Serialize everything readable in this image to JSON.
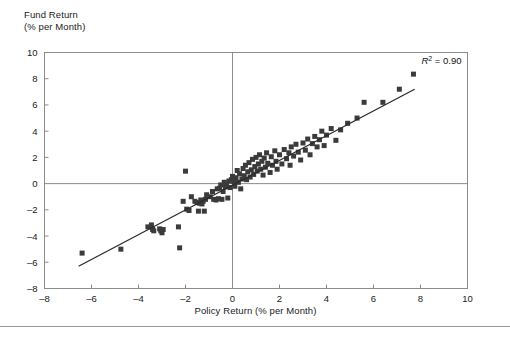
{
  "figure": {
    "y_axis_title_line1": "Fund Return",
    "y_axis_title_line2": "(% per Month)",
    "x_axis_title": "Policy Return (% per Month)",
    "annotation_r2_symbol": "R",
    "annotation_r2_exponent": "2",
    "annotation_r2_value": "= 0.90",
    "marker_color": "#3b3b3b",
    "line_color": "#2b2b2b",
    "axis_color": "#8c8c8c",
    "text_color": "#1a1a1a"
  },
  "chart_data": {
    "type": "scatter",
    "title": "",
    "subtitle": "",
    "xlabel": "Policy Return (% per Month)",
    "ylabel": "Fund Return (% per Month)",
    "xlim": [
      -8,
      10
    ],
    "ylim": [
      -8,
      10
    ],
    "xticks": [
      -8,
      -6,
      -4,
      -2,
      0,
      2,
      4,
      6,
      8,
      10
    ],
    "yticks": [
      -8,
      -6,
      -4,
      -2,
      0,
      2,
      4,
      6,
      8,
      10
    ],
    "xtick_labels": [
      "-8",
      "-6",
      "-4",
      "-2",
      "0",
      "2",
      "4",
      "6",
      "8",
      "10"
    ],
    "ytick_labels": [
      "-8",
      "-6",
      "-4",
      "-2",
      "0",
      "2",
      "4",
      "6",
      "8",
      "10"
    ],
    "grid": false,
    "legend_position": "none",
    "annotations": [
      {
        "text": "R2 = 0.90",
        "x": 7.6,
        "y": 9.1,
        "statistic": "r_squared",
        "value": 0.9
      }
    ],
    "reference_lines": [
      {
        "orientation": "vertical",
        "value": 0
      },
      {
        "orientation": "horizontal",
        "value": 0
      }
    ],
    "fit_line": {
      "type": "linear_regression",
      "x_start": -6.55,
      "y_start": -6.3,
      "x_end": 7.75,
      "y_end": 7.2,
      "slope": 0.944,
      "intercept": -0.12,
      "r_squared": 0.9
    },
    "marker": {
      "shape": "square",
      "size_px": 5,
      "color": "#3b3b3b"
    },
    "series": [
      {
        "name": "Funds",
        "n_points": 112,
        "points": [
          [
            -6.4,
            -5.3
          ],
          [
            -4.75,
            -5.0
          ],
          [
            -3.6,
            -3.3
          ],
          [
            -3.45,
            -3.15
          ],
          [
            -3.4,
            -3.5
          ],
          [
            -3.35,
            -3.6
          ],
          [
            -3.1,
            -3.45
          ],
          [
            -3.05,
            -3.6
          ],
          [
            -3.0,
            -3.75
          ],
          [
            -2.95,
            -3.5
          ],
          [
            -2.3,
            -3.3
          ],
          [
            -2.25,
            -4.9
          ],
          [
            -2.1,
            -1.35
          ],
          [
            -2.0,
            0.95
          ],
          [
            -1.95,
            -1.95
          ],
          [
            -1.85,
            -2.05
          ],
          [
            -1.75,
            -1.0
          ],
          [
            -1.6,
            -1.35
          ],
          [
            -1.5,
            -1.45
          ],
          [
            -1.45,
            -2.1
          ],
          [
            -1.4,
            -1.5
          ],
          [
            -1.35,
            -1.25
          ],
          [
            -1.3,
            -1.55
          ],
          [
            -1.25,
            -1.35
          ],
          [
            -1.2,
            -2.1
          ],
          [
            -1.15,
            -1.2
          ],
          [
            -1.1,
            -0.85
          ],
          [
            -0.95,
            -1.0
          ],
          [
            -0.85,
            -0.6
          ],
          [
            -0.8,
            -1.2
          ],
          [
            -0.7,
            -1.25
          ],
          [
            -0.65,
            -0.4
          ],
          [
            -0.6,
            -1.15
          ],
          [
            -0.55,
            -0.35
          ],
          [
            -0.5,
            -0.1
          ],
          [
            -0.45,
            -1.2
          ],
          [
            -0.4,
            -0.6
          ],
          [
            -0.35,
            0.1
          ],
          [
            -0.3,
            -0.25
          ],
          [
            -0.25,
            -0.05
          ],
          [
            -0.2,
            -1.1
          ],
          [
            -0.15,
            0.2
          ],
          [
            -0.1,
            -0.3
          ],
          [
            -0.05,
            0.3
          ],
          [
            0.0,
            0.55
          ],
          [
            0.05,
            0.15
          ],
          [
            0.1,
            -0.2
          ],
          [
            0.15,
            0.45
          ],
          [
            0.2,
            1.0
          ],
          [
            0.25,
            0.1
          ],
          [
            0.3,
            0.75
          ],
          [
            0.35,
            -0.4
          ],
          [
            0.4,
            0.35
          ],
          [
            0.45,
            1.15
          ],
          [
            0.5,
            0.6
          ],
          [
            0.55,
            1.4
          ],
          [
            0.6,
            0.3
          ],
          [
            0.65,
            0.9
          ],
          [
            0.7,
            1.6
          ],
          [
            0.75,
            0.5
          ],
          [
            0.8,
            1.05
          ],
          [
            0.85,
            1.85
          ],
          [
            0.9,
            0.7
          ],
          [
            0.95,
            1.3
          ],
          [
            1.0,
            2.0
          ],
          [
            1.05,
            0.95
          ],
          [
            1.1,
            1.5
          ],
          [
            1.15,
            2.2
          ],
          [
            1.2,
            1.1
          ],
          [
            1.25,
            1.7
          ],
          [
            1.3,
            0.65
          ],
          [
            1.35,
            1.95
          ],
          [
            1.4,
            1.25
          ],
          [
            1.45,
            2.35
          ],
          [
            1.5,
            1.55
          ],
          [
            1.6,
            0.85
          ],
          [
            1.65,
            2.05
          ],
          [
            1.7,
            1.4
          ],
          [
            1.8,
            2.5
          ],
          [
            1.85,
            1.7
          ],
          [
            1.9,
            1.1
          ],
          [
            2.0,
            2.2
          ],
          [
            2.1,
            1.5
          ],
          [
            2.2,
            2.6
          ],
          [
            2.3,
            1.9
          ],
          [
            2.4,
            2.35
          ],
          [
            2.45,
            1.4
          ],
          [
            2.5,
            2.8
          ],
          [
            2.6,
            2.1
          ],
          [
            2.7,
            3.0
          ],
          [
            2.8,
            2.4
          ],
          [
            2.9,
            1.8
          ],
          [
            3.0,
            3.1
          ],
          [
            3.1,
            2.55
          ],
          [
            3.2,
            3.4
          ],
          [
            3.3,
            2.2
          ],
          [
            3.4,
            3.05
          ],
          [
            3.5,
            3.6
          ],
          [
            3.6,
            2.8
          ],
          [
            3.7,
            3.35
          ],
          [
            3.8,
            4.0
          ],
          [
            3.9,
            2.9
          ],
          [
            4.0,
            3.7
          ],
          [
            4.2,
            4.2
          ],
          [
            4.4,
            3.3
          ],
          [
            4.6,
            4.1
          ],
          [
            4.9,
            4.6
          ],
          [
            5.3,
            5.0
          ],
          [
            5.6,
            6.2
          ],
          [
            6.4,
            6.2
          ],
          [
            7.1,
            7.2
          ],
          [
            7.7,
            8.35
          ]
        ]
      }
    ]
  }
}
